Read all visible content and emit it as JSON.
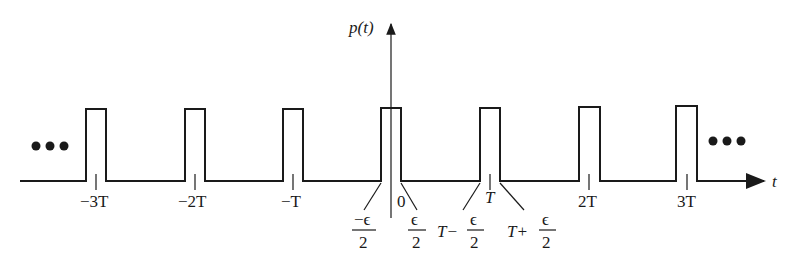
{
  "diagram": {
    "y_axis_label": "p(t)",
    "x_axis_label": "t",
    "ellipsis_left": "•••",
    "ellipsis_right": "•••",
    "tick_labels": [
      "−3T",
      "−2T",
      "−T",
      "0",
      "T",
      "2T",
      "3T"
    ],
    "pulse_centers": [
      "−3T",
      "−2T",
      "−T",
      "0",
      "T",
      "2T",
      "3T"
    ],
    "annotations": {
      "neg_half_width_num": "−ϵ",
      "neg_half_width_den": "2",
      "pos_half_width_num": "ϵ",
      "pos_half_width_den": "2",
      "t_minus_prefix": "T−",
      "t_minus_num": "ϵ",
      "t_minus_den": "2",
      "t_plus_prefix": "T+",
      "t_plus_num": "ϵ",
      "t_plus_den": "2"
    }
  }
}
